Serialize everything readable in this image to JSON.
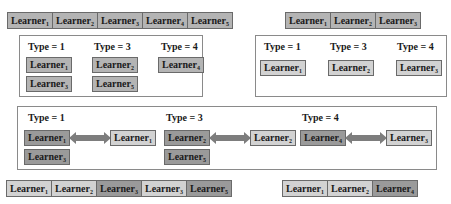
{
  "top_left_strip": [
    {
      "name": "Learner",
      "sub": "1",
      "shade": "mid"
    },
    {
      "name": "Learner",
      "sub": "2",
      "shade": "mid"
    },
    {
      "name": "Learner",
      "sub": "3",
      "shade": "mid"
    },
    {
      "name": "Learner",
      "sub": "4",
      "shade": "mid"
    },
    {
      "name": "Learner",
      "sub": "5",
      "shade": "mid"
    }
  ],
  "top_right_strip": [
    {
      "name": "Learner",
      "sub": "1",
      "shade": "mid"
    },
    {
      "name": "Learner",
      "sub": "2",
      "shade": "mid"
    },
    {
      "name": "Learner",
      "sub": "3",
      "shade": "mid"
    }
  ],
  "left_box": {
    "types": [
      "Type = 1",
      "Type = 3",
      "Type = 4"
    ],
    "learners": [
      {
        "name": "Learner",
        "sub": "1"
      },
      {
        "name": "Learner",
        "sub": "3"
      },
      {
        "name": "Learner",
        "sub": "2"
      },
      {
        "name": "Learner",
        "sub": "5"
      },
      {
        "name": "Learner",
        "sub": "4"
      }
    ]
  },
  "right_box": {
    "types": [
      "Type = 1",
      "Type = 3",
      "Type = 4"
    ],
    "learners": [
      {
        "name": "Learner",
        "sub": "1"
      },
      {
        "name": "Learner",
        "sub": "2"
      },
      {
        "name": "Learner",
        "sub": "3"
      }
    ]
  },
  "middle_box": {
    "types": [
      "Type = 1",
      "Type = 3",
      "Type = 4"
    ],
    "pairs": [
      {
        "left": {
          "name": "Learner",
          "sub": "1"
        },
        "right": {
          "name": "Learner",
          "sub": "1"
        }
      },
      {
        "left": {
          "name": "Learner",
          "sub": "2"
        },
        "right": {
          "name": "Learner",
          "sub": "2"
        }
      },
      {
        "left": {
          "name": "Learner",
          "sub": "4"
        },
        "right": {
          "name": "Learner",
          "sub": "3"
        }
      }
    ],
    "extras": [
      {
        "name": "Learner",
        "sub": "3"
      },
      {
        "name": "Learner",
        "sub": "5"
      }
    ]
  },
  "bottom_left_strip": [
    {
      "name": "Learner",
      "sub": "1",
      "shade": "light"
    },
    {
      "name": "Learner",
      "sub": "2",
      "shade": "light"
    },
    {
      "name": "Learner",
      "sub": "3",
      "shade": "dark"
    },
    {
      "name": "Learner",
      "sub": "3",
      "shade": "light"
    },
    {
      "name": "Learner",
      "sub": "5",
      "shade": "dark"
    }
  ],
  "bottom_right_strip": [
    {
      "name": "Learner",
      "sub": "1",
      "shade": "light"
    },
    {
      "name": "Learner",
      "sub": "2",
      "shade": "light"
    },
    {
      "name": "Learner",
      "sub": "4",
      "shade": "dark"
    }
  ],
  "colors": {
    "dark": "#9a9a9a",
    "mid": "#b4b4b4",
    "light": "#d2d2d2",
    "arrow": "#7d7d7d",
    "border": "#6a6a6a"
  }
}
